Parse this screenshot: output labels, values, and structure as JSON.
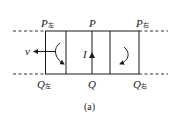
{
  "figure": {
    "caption": "(a)",
    "labels": {
      "p_left": {
        "main": "P",
        "sub": "左"
      },
      "p_mid": {
        "main": "P",
        "sub": ""
      },
      "p_right": {
        "main": "P",
        "sub": "右"
      },
      "q_left": {
        "main": "Q",
        "sub": "左"
      },
      "q_mid": {
        "main": "Q",
        "sub": ""
      },
      "q_right": {
        "main": "Q",
        "sub": "右"
      },
      "velocity": "v",
      "current": "I"
    },
    "colors": {
      "line": "#1a1a1a",
      "background": "#ffffff"
    },
    "elements": {
      "box": "rectangular loop between rails",
      "left_arrow": "velocity arrow pointing left",
      "current_arrow": "upward current arrow on PQ",
      "left_loop_arrow": "clockwise curved arrow",
      "right_loop_arrow": "counterclockwise curved arrow"
    }
  }
}
